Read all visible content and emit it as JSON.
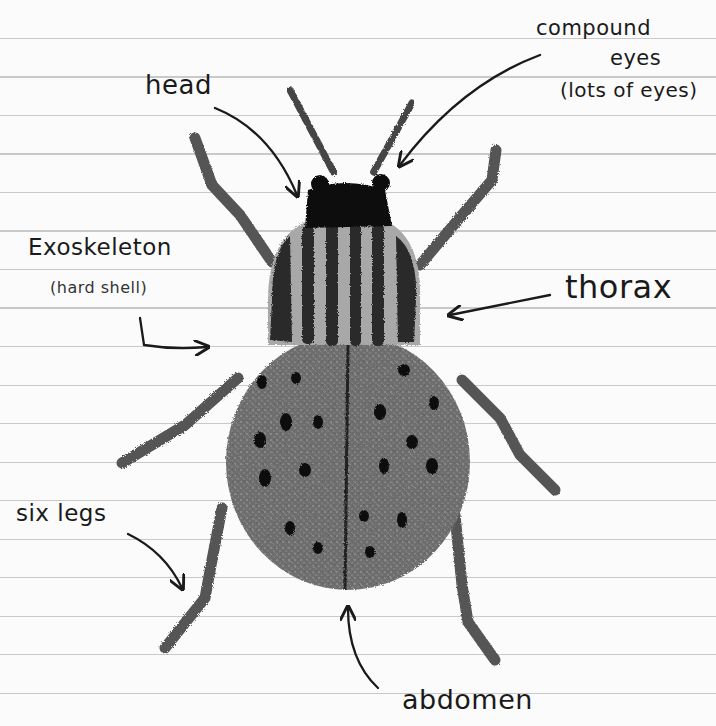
{
  "diagram": {
    "type": "hand-drawn labeled insect anatomy diagram on ruled notebook paper",
    "labels": {
      "head": "head",
      "compound_eyes_line1": "compound",
      "compound_eyes_line2": "eyes",
      "compound_eyes_note": "(lots of eyes)",
      "exoskeleton": "Exoskeleton",
      "exoskeleton_note": "(hard shell)",
      "thorax": "thorax",
      "six_legs": "six legs",
      "abdomen": "abdomen"
    },
    "colors": {
      "paper": "#fbfbfb",
      "rule_line": "#c9c9c9",
      "ink": "#1a1a1a",
      "body_gray": "#6e6e6e",
      "stripe_dark": "#2a2a2a",
      "stripe_light": "#a8a8a8",
      "head_black": "#111111"
    }
  }
}
